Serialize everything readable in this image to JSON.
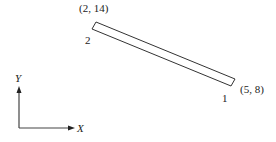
{
  "diagram": {
    "type": "bar-element-in-plane",
    "element": {
      "node_start": {
        "id": "1",
        "coordinates": "(5, 8)"
      },
      "node_end": {
        "id": "2",
        "coordinates": "(2, 14)"
      }
    },
    "axes": {
      "x_label": "X",
      "y_label": "Y"
    }
  }
}
